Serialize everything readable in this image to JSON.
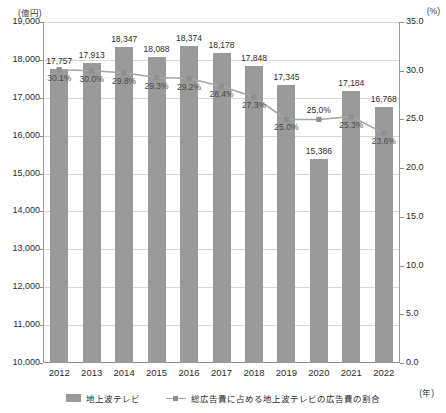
{
  "chart_data": {
    "type": "bar",
    "title": "",
    "subtitle": "",
    "xlabel": "(年)",
    "ylabel": "(億円)",
    "y2label": "(%)",
    "categories": [
      "2012",
      "2013",
      "2014",
      "2015",
      "2016",
      "2017",
      "2018",
      "2019",
      "2020",
      "2021",
      "2022"
    ],
    "ylim": [
      10000,
      19000
    ],
    "yticks": [
      "10,000",
      "11,000",
      "12,000",
      "13,000",
      "14,000",
      "15,000",
      "16,000",
      "17,000",
      "18,000",
      "19,000"
    ],
    "ytick_values": [
      10000,
      11000,
      12000,
      13000,
      14000,
      15000,
      16000,
      17000,
      18000,
      19000
    ],
    "y2lim": [
      0.0,
      35.0
    ],
    "y2ticks": [
      "0.0",
      "5.0",
      "10.0",
      "15.0",
      "20.0",
      "25.0",
      "30.0",
      "35.0"
    ],
    "y2tick_values": [
      0,
      5,
      10,
      15,
      20,
      25,
      30,
      35
    ],
    "grid": true,
    "legend_position": "bottom",
    "series": [
      {
        "name": "地上波テレビ",
        "type": "bar",
        "axis": "left",
        "color": "#9a9a9a",
        "values": [
          17757,
          17913,
          18347,
          18088,
          18374,
          18178,
          17848,
          17345,
          15386,
          17184,
          16768
        ],
        "labels": [
          "17,757",
          "17,913",
          "18,347",
          "18,088",
          "18,374",
          "18,178",
          "17,848",
          "17,345",
          "15,386",
          "17,184",
          "16,768"
        ]
      },
      {
        "name": "総広告費に占める地上波テレビの広告費の割合",
        "type": "line",
        "axis": "right",
        "color": "#a5a5a5",
        "values": [
          30.1,
          30.0,
          29.8,
          29.3,
          29.2,
          28.4,
          27.3,
          25.0,
          25.0,
          25.3,
          23.6
        ],
        "labels": [
          "30.1%",
          "30.0%",
          "29.8%",
          "29.3%",
          "29.2%",
          "28.4%",
          "27.3%",
          "25.0%",
          "25.0%",
          "25.3%",
          "23.6%"
        ]
      }
    ]
  },
  "legend": {
    "items": [
      {
        "label": "地上波テレビ",
        "marker": "bar-swatch"
      },
      {
        "label": "総広告費に占める地上波テレビの広告費の割合",
        "marker": "line-marker-swatch"
      }
    ]
  }
}
